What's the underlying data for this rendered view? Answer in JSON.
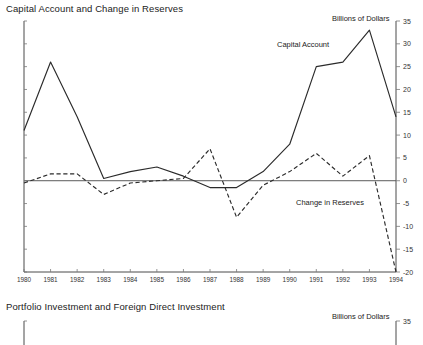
{
  "panel1": {
    "title": "Capital Account and Change in Reserves",
    "units": "Billions of Dollars",
    "label_capital_account": "Capital Account",
    "label_change_reserves": "Change in Reserves"
  },
  "panel2": {
    "title": "Portfolio Investment and Foreign Direct Investment",
    "units": "Billions of Dollars",
    "first_ytick": "35"
  },
  "chart_data": {
    "type": "line",
    "title": "Capital Account and Change in Reserves",
    "subtitle": "",
    "xlabel": "",
    "ylabel": "Billions of Dollars",
    "units": "Billions of Dollars",
    "x": [
      1980,
      1981,
      1982,
      1983,
      1984,
      1985,
      1986,
      1987,
      1988,
      1989,
      1990,
      1991,
      1992,
      1993,
      1994
    ],
    "categories": [
      "1980",
      "1981",
      "1982",
      "1983",
      "1984",
      "1985",
      "1986",
      "1987",
      "1988",
      "1989",
      "1990",
      "1991",
      "1992",
      "1993",
      "1994"
    ],
    "xlim": [
      1980,
      1994
    ],
    "ylim": [
      -20,
      35
    ],
    "yticks": [
      -20,
      -15,
      -10,
      -5,
      0,
      5,
      10,
      15,
      20,
      25,
      30,
      35
    ],
    "ytick_labels": [
      "-20",
      "-15",
      "-10",
      "-5",
      "0",
      "5",
      "10",
      "15",
      "20",
      "25",
      "30",
      "35"
    ],
    "grid": false,
    "legend_position": "inline-annotation",
    "zero_line": true,
    "series": [
      {
        "name": "Capital Account",
        "style": "solid",
        "values": [
          11,
          26,
          14,
          0.5,
          2,
          3,
          1,
          -1.5,
          -1.5,
          2,
          8,
          25,
          26,
          33,
          14
        ]
      },
      {
        "name": "Change in Reserves",
        "style": "dashed",
        "values": [
          -0.5,
          1.5,
          1.5,
          -3,
          -0.5,
          0,
          0.5,
          7,
          -8,
          -1,
          2,
          6,
          1,
          5.5,
          -20
        ]
      }
    ]
  }
}
